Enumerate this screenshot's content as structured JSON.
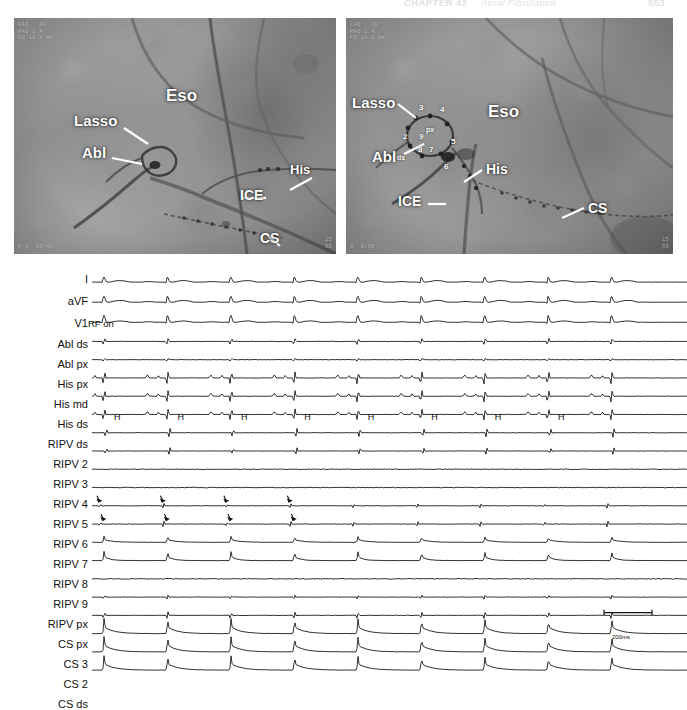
{
  "running_head": {
    "chapter": "CHAPTER 42",
    "title": "Atrial Fibrillation",
    "page": "553"
  },
  "figure": {
    "panels": [
      {
        "id": "fluoro-left",
        "name": "fluoroscopy-rao",
        "osd_top_left": "RAO   40\nRAO 1.4\nFD 19.0 mm",
        "osd_bottom_left": "F 0  95/40",
        "osd_bottom_right": "15\n55",
        "labels": [
          {
            "text": "Eso",
            "x": 152,
            "y": 78,
            "size": 17
          },
          {
            "text": "Lasso",
            "x": 60,
            "y": 103,
            "size": 15
          },
          {
            "text": "Abl",
            "x": 68,
            "y": 135,
            "size": 15
          },
          {
            "text": "His",
            "x": 274,
            "y": 152,
            "size": 13
          },
          {
            "text": "ICE",
            "x": 223,
            "y": 177,
            "size": 14
          },
          {
            "text": "CS",
            "x": 243,
            "y": 219,
            "size": 14
          }
        ]
      },
      {
        "id": "fluoro-right",
        "name": "fluoroscopy-lao",
        "osd_top_left": "LAO   60\nRAO 1.4\nFD 19.0 mm",
        "osd_bottom_left": "0  0/60",
        "osd_bottom_right": "15\n55",
        "labels": [
          {
            "text": "Lasso",
            "x": 6,
            "y": 85,
            "size": 15
          },
          {
            "text": "Eso",
            "x": 142,
            "y": 94,
            "size": 17
          },
          {
            "text": "Abl",
            "x": 26,
            "y": 139,
            "size": 15
          },
          {
            "text": "His",
            "x": 139,
            "y": 151,
            "size": 14
          },
          {
            "text": "ICE",
            "x": 52,
            "y": 183,
            "size": 14
          },
          {
            "text": "CS",
            "x": 240,
            "y": 190,
            "size": 14
          }
        ],
        "lasso_electrodes": [
          {
            "text": "3",
            "x": 73,
            "y": 91
          },
          {
            "text": "4",
            "x": 94,
            "y": 93
          },
          {
            "text": "2",
            "x": 59,
            "y": 121
          },
          {
            "text": "px",
            "x": 81,
            "y": 115
          },
          {
            "text": "9",
            "x": 75,
            "y": 120
          },
          {
            "text": "5",
            "x": 105,
            "y": 125
          },
          {
            "text": "8",
            "x": 74,
            "y": 133
          },
          {
            "text": "7",
            "x": 84,
            "y": 133
          },
          {
            "text": "ds",
            "x": 53,
            "y": 142
          },
          {
            "text": "6",
            "x": 98,
            "y": 150
          }
        ]
      }
    ]
  },
  "tracings": {
    "name": "intracardiac-electrogram-recording",
    "channels": [
      {
        "label": "I",
        "y": 18,
        "size": 11
      },
      {
        "label": "aVF",
        "y": 40,
        "size": 11
      },
      {
        "label": "V1",
        "y": 62,
        "size": 11
      },
      {
        "label": "Abl ds",
        "y": 83,
        "size": 11
      },
      {
        "label": "Abl px",
        "y": 103,
        "size": 11
      },
      {
        "label": "His px",
        "y": 123,
        "size": 11
      },
      {
        "label": "His md",
        "y": 143,
        "size": 11
      },
      {
        "label": "His ds",
        "y": 163,
        "size": 11
      },
      {
        "label": "RIPV ds",
        "y": 183,
        "size": 11
      },
      {
        "label": "RIPV 2",
        "y": 203,
        "size": 11
      },
      {
        "label": "RIPV 3",
        "y": 223,
        "size": 11
      },
      {
        "label": "RIPV 4",
        "y": 243,
        "size": 11
      },
      {
        "label": "RIPV 5",
        "y": 263,
        "size": 11
      },
      {
        "label": "RIPV 6",
        "y": 283,
        "size": 11
      },
      {
        "label": "RIPV 7",
        "y": 303,
        "size": 11
      },
      {
        "label": "RIPV 8",
        "y": 323,
        "size": 11
      },
      {
        "label": "RIPV 9",
        "y": 343,
        "size": 11
      },
      {
        "label": "RIPV px",
        "y": 363,
        "size": 11
      },
      {
        "label": "CS px",
        "y": 383,
        "size": 11
      },
      {
        "label": "CS 3",
        "y": 403,
        "size": 11
      },
      {
        "label": "CS 2",
        "y": 423,
        "size": 11
      },
      {
        "label": "CS ds",
        "y": 443,
        "size": 11
      }
    ],
    "annotations": {
      "rf_on": "RF on",
      "his_marker": "H",
      "his_marker_count": 8,
      "scale_bar": "200ms"
    },
    "beat_count": 9,
    "arrow_count": 8
  },
  "colors": {
    "label_text": "#111111",
    "fluoro_label": "#ffffff",
    "trace_ink": "#111111",
    "running_head": "#e2e2e6"
  }
}
